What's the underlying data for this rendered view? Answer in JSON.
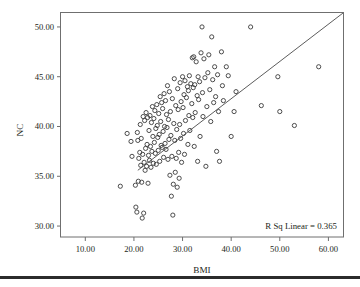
{
  "figure": {
    "background_color": "#ffffff",
    "frame_color": "#6f6f6f",
    "marker_color": "#3a3a3a",
    "line_color": "#4a4a4a",
    "text_color": "#231f20",
    "footer_rule_color": "#2b2b2b"
  },
  "chart_data": {
    "type": "scatter",
    "title": "",
    "subtitle": "",
    "xlabel": "BMI",
    "ylabel": "NC",
    "xlim": [
      5.0,
      63.0
    ],
    "ylim": [
      28.9,
      51.4
    ],
    "xticks": [
      10.0,
      20.0,
      30.0,
      40.0,
      50.0,
      60.0
    ],
    "xtick_labels": [
      "10.00",
      "20.00",
      "30.00",
      "40.00",
      "50.00",
      "60.00"
    ],
    "yticks": [
      30.0,
      35.0,
      40.0,
      45.0,
      50.0
    ],
    "ytick_labels": [
      "30.00",
      "35.00",
      "40.00",
      "45.00",
      "50.00"
    ],
    "grid": false,
    "legend": null,
    "marker": "open-circle",
    "annotations": [
      {
        "text": "R Sq Linear = 0.365",
        "x": 58.0,
        "y": 30.2,
        "align": "right"
      }
    ],
    "fit_line": {
      "type": "linear",
      "r_squared": 0.365,
      "x_start": 20.8,
      "y_start": 35.6,
      "x_end": 63.0,
      "y_end": 51.4
    },
    "points": [
      [
        17.2,
        34.0
      ],
      [
        18.6,
        39.3
      ],
      [
        19.4,
        38.5
      ],
      [
        19.6,
        37.0
      ],
      [
        20.3,
        34.1
      ],
      [
        20.4,
        31.9
      ],
      [
        20.6,
        31.4
      ],
      [
        20.7,
        39.4
      ],
      [
        20.8,
        38.6
      ],
      [
        20.9,
        34.5
      ],
      [
        21.0,
        36.8
      ],
      [
        21.2,
        37.4
      ],
      [
        21.3,
        40.2
      ],
      [
        21.4,
        36.1
      ],
      [
        21.5,
        38.8
      ],
      [
        21.6,
        34.4
      ],
      [
        21.7,
        30.8
      ],
      [
        21.8,
        37.2
      ],
      [
        21.9,
        41.0
      ],
      [
        22.0,
        31.3
      ],
      [
        22.1,
        36.4
      ],
      [
        22.2,
        40.6
      ],
      [
        22.3,
        35.6
      ],
      [
        22.4,
        37.8
      ],
      [
        22.5,
        41.4
      ],
      [
        22.6,
        36.0
      ],
      [
        22.7,
        38.2
      ],
      [
        22.8,
        40.9
      ],
      [
        22.9,
        34.3
      ],
      [
        23.0,
        37.1
      ],
      [
        23.1,
        39.6
      ],
      [
        23.2,
        36.6
      ],
      [
        23.3,
        41.1
      ],
      [
        23.4,
        38.0
      ],
      [
        23.5,
        35.9
      ],
      [
        23.6,
        40.4
      ],
      [
        23.7,
        37.5
      ],
      [
        23.8,
        42.0
      ],
      [
        23.9,
        39.0
      ],
      [
        24.0,
        36.3
      ],
      [
        24.1,
        40.8
      ],
      [
        24.2,
        38.4
      ],
      [
        24.3,
        41.6
      ],
      [
        24.4,
        37.3
      ],
      [
        24.5,
        39.8
      ],
      [
        24.6,
        36.2
      ],
      [
        24.7,
        42.2
      ],
      [
        24.8,
        40.1
      ],
      [
        24.9,
        38.9
      ],
      [
        25.0,
        37.6
      ],
      [
        25.1,
        41.3
      ],
      [
        25.2,
        39.2
      ],
      [
        25.3,
        36.5
      ],
      [
        25.4,
        43.0
      ],
      [
        25.5,
        40.5
      ],
      [
        25.6,
        38.1
      ],
      [
        25.7,
        42.4
      ],
      [
        25.8,
        37.9
      ],
      [
        25.9,
        41.8
      ],
      [
        26.0,
        39.5
      ],
      [
        26.1,
        36.9
      ],
      [
        26.2,
        43.3
      ],
      [
        26.3,
        40.0
      ],
      [
        26.4,
        38.3
      ],
      [
        26.5,
        42.6
      ],
      [
        26.6,
        37.7
      ],
      [
        26.7,
        41.2
      ],
      [
        26.8,
        39.9
      ],
      [
        26.9,
        44.1
      ],
      [
        27.0,
        36.7
      ],
      [
        27.1,
        40.7
      ],
      [
        27.2,
        38.7
      ],
      [
        27.3,
        43.5
      ],
      [
        27.4,
        35.1
      ],
      [
        27.5,
        41.5
      ],
      [
        27.6,
        39.1
      ],
      [
        27.7,
        33.0
      ],
      [
        27.8,
        37.0
      ],
      [
        27.9,
        42.8
      ],
      [
        28.0,
        31.1
      ],
      [
        28.1,
        34.2
      ],
      [
        28.2,
        40.3
      ],
      [
        28.3,
        44.8
      ],
      [
        28.4,
        38.6
      ],
      [
        28.5,
        35.4
      ],
      [
        28.6,
        42.1
      ],
      [
        28.7,
        36.8
      ],
      [
        28.8,
        39.7
      ],
      [
        28.9,
        33.9
      ],
      [
        29.0,
        43.8
      ],
      [
        29.1,
        41.7
      ],
      [
        29.2,
        37.4
      ],
      [
        29.3,
        34.8
      ],
      [
        29.4,
        40.2
      ],
      [
        29.5,
        44.4
      ],
      [
        29.6,
        38.8
      ],
      [
        29.7,
        42.5
      ],
      [
        29.8,
        36.4
      ],
      [
        30.0,
        45.0
      ],
      [
        30.1,
        41.9
      ],
      [
        30.2,
        39.3
      ],
      [
        30.3,
        43.2
      ],
      [
        30.4,
        37.2
      ],
      [
        30.5,
        44.6
      ],
      [
        30.6,
        40.6
      ],
      [
        30.8,
        42.9
      ],
      [
        31.0,
        44.0
      ],
      [
        31.1,
        38.2
      ],
      [
        31.2,
        43.6
      ],
      [
        31.3,
        41.1
      ],
      [
        31.4,
        45.1
      ],
      [
        31.5,
        39.6
      ],
      [
        31.7,
        44.3
      ],
      [
        31.9,
        42.3
      ],
      [
        32.0,
        46.9
      ],
      [
        32.1,
        40.9
      ],
      [
        32.2,
        43.9
      ],
      [
        32.3,
        47.0
      ],
      [
        32.4,
        38.0
      ],
      [
        32.5,
        44.2
      ],
      [
        32.6,
        41.4
      ],
      [
        32.8,
        46.5
      ],
      [
        33.0,
        43.1
      ],
      [
        33.1,
        36.5
      ],
      [
        33.2,
        45.0
      ],
      [
        33.3,
        42.7
      ],
      [
        33.5,
        44.5
      ],
      [
        33.6,
        39.0
      ],
      [
        33.8,
        47.4
      ],
      [
        34.0,
        50.0
      ],
      [
        34.1,
        43.4
      ],
      [
        34.2,
        41.0
      ],
      [
        34.4,
        46.8
      ],
      [
        34.6,
        44.9
      ],
      [
        34.8,
        36.0
      ],
      [
        35.0,
        42.0
      ],
      [
        35.2,
        45.4
      ],
      [
        35.4,
        47.2
      ],
      [
        35.6,
        43.7
      ],
      [
        35.8,
        40.5
      ],
      [
        36.0,
        49.0
      ],
      [
        36.2,
        44.7
      ],
      [
        36.4,
        42.4
      ],
      [
        36.6,
        46.0
      ],
      [
        36.8,
        43.0
      ],
      [
        37.0,
        37.5
      ],
      [
        37.2,
        45.2
      ],
      [
        37.4,
        41.5
      ],
      [
        37.6,
        36.5
      ],
      [
        38.0,
        47.5
      ],
      [
        38.2,
        44.1
      ],
      [
        38.4,
        42.6
      ],
      [
        39.0,
        46.0
      ],
      [
        39.4,
        45.1
      ],
      [
        40.0,
        39.0
      ],
      [
        40.6,
        41.5
      ],
      [
        41.0,
        43.5
      ],
      [
        44.0,
        50.0
      ],
      [
        46.2,
        42.1
      ],
      [
        49.6,
        45.0
      ],
      [
        50.0,
        41.5
      ],
      [
        53.0,
        40.1
      ],
      [
        58.0,
        46.0
      ]
    ]
  }
}
